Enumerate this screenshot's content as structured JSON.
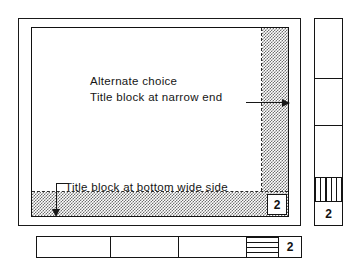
{
  "figure": {
    "name": "drawing-sheet-title-block-layout",
    "background_color": "#ffffff",
    "line_color": "#141414",
    "shading_color": "#6f6f6f"
  },
  "sheet": {
    "corner_zone_number": "2",
    "annotations": {
      "alternate_line1": "Alternate choice",
      "alternate_line2": "Title block at narrow end",
      "bottom_wide": "Title block at bottom wide side"
    },
    "bands": {
      "right_narrow_end_label": "title-block-band-narrow-end",
      "bottom_wide_side_label": "title-block-band-bottom-wide"
    }
  },
  "vertical_strip": {
    "cells": [
      "",
      "",
      ""
    ],
    "hatch_cell": "",
    "zone_number": "2"
  },
  "horizontal_strip": {
    "cells": [
      "",
      "",
      ""
    ],
    "hatch_cell": "",
    "zone_number": "2"
  }
}
